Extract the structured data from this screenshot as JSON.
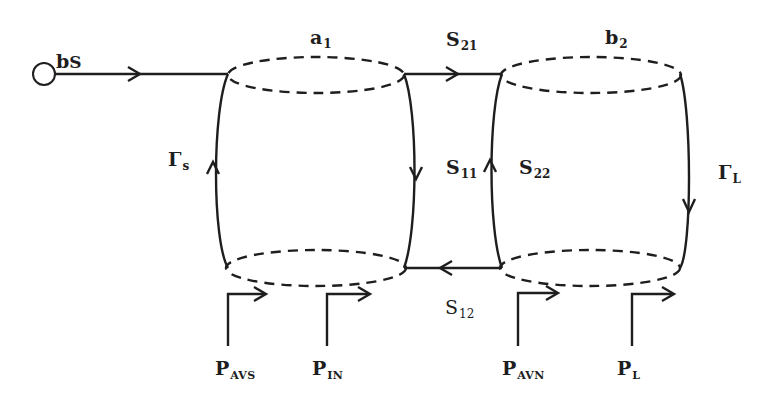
{
  "diagram": {
    "title": "",
    "type": "signal-flow / power-wave diagram of two-port network",
    "colors": {
      "line": "#1e1e1e",
      "background": "#ffffff"
    },
    "nodes": {
      "source": {
        "main": "b",
        "sub": "S"
      },
      "a1": {
        "main": "a",
        "sub": "1"
      },
      "b2": {
        "main": "b",
        "sub": "2"
      }
    },
    "branch_labels": {
      "S21": {
        "main": "S",
        "sub": "21"
      },
      "S11": {
        "main": "S",
        "sub": "11"
      },
      "S22": {
        "main": "S",
        "sub": "22"
      },
      "S12": {
        "main": "S",
        "sub": "12"
      },
      "gamma_s": {
        "main": "Γ",
        "sub": "s"
      },
      "gamma_L": {
        "main": "Γ",
        "sub": "L"
      }
    },
    "power_labels": {
      "P_AVS": {
        "main": "P",
        "sub": "AVS"
      },
      "P_IN": {
        "main": "P",
        "sub": "IN"
      },
      "P_AVN": {
        "main": "P",
        "sub": "AVN"
      },
      "P_L": {
        "main": "P",
        "sub": "L"
      }
    }
  }
}
